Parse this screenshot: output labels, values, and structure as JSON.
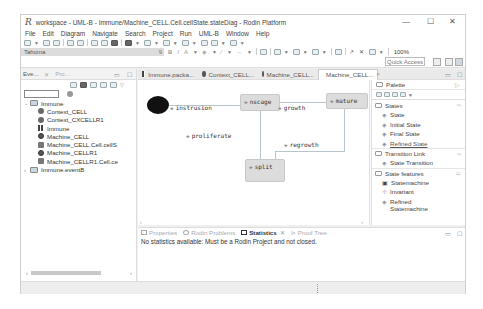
{
  "window": {
    "title": "workspace - UML-B - Immune/Machine_CELL.Cell.cellState.stateDiag - Rodin Platform",
    "app_icon": "R",
    "controls": {
      "minimize": "—",
      "maximize": "☐",
      "close": "✕"
    }
  },
  "menu": [
    "File",
    "Edit",
    "Diagram",
    "Navigate",
    "Search",
    "Project",
    "Run",
    "UML-B",
    "Window",
    "Help"
  ],
  "toolbar": {
    "font_family": "Tahoma",
    "font_size": "9",
    "bold": "B",
    "italic": "I",
    "font_color": "A",
    "zoom": "100%",
    "quick_access": "Quick Access"
  },
  "explorer": {
    "tabs": [
      {
        "label": "Eve...",
        "active": true
      },
      {
        "label": "Pro...",
        "active": false
      }
    ],
    "filter_placeholder": "",
    "tree": [
      {
        "label": "Immune",
        "level": 0,
        "expanded": true,
        "icon": "project"
      },
      {
        "label": "Context_CELL",
        "level": 1,
        "icon": "context"
      },
      {
        "label": "Context_CXCELLR1",
        "level": 1,
        "icon": "context"
      },
      {
        "label": "Immune",
        "level": 1,
        "icon": "package-diagram"
      },
      {
        "label": "Machine_CELL",
        "level": 1,
        "icon": "machine"
      },
      {
        "label": "Machine_CELL.Cell.cellS",
        "level": 1,
        "icon": "statemachine"
      },
      {
        "label": "Machine_CELLR1",
        "level": 1,
        "icon": "machine"
      },
      {
        "label": "Machine_CELLR1.Cell.ce",
        "level": 1,
        "icon": "statemachine"
      },
      {
        "label": "Immune.eventB",
        "level": 0,
        "expanded": false,
        "icon": "project"
      }
    ]
  },
  "editor": {
    "tabs": [
      {
        "label": "Immune.packa...",
        "icon": "package-diagram",
        "active": false
      },
      {
        "label": "Context_CELL...",
        "icon": "context",
        "active": false
      },
      {
        "label": "Machine_CELL...",
        "icon": "machine",
        "active": false
      },
      {
        "label": "Machine_CELL...",
        "icon": "statemachine",
        "active": true,
        "close": "✕"
      }
    ],
    "diagram": {
      "states": [
        {
          "name": "nscage",
          "x": 102,
          "y": 14,
          "w": 40,
          "h": 17
        },
        {
          "name": "mature",
          "x": 188,
          "y": 13,
          "w": 42,
          "h": 16
        },
        {
          "name": "split",
          "x": 107,
          "y": 79,
          "w": 40,
          "h": 23
        }
      ],
      "transitions": [
        {
          "label": "instrusion",
          "x": 32,
          "y": 27
        },
        {
          "label": "growth",
          "x": 140,
          "y": 27
        },
        {
          "label": "proliferate",
          "x": 48,
          "y": 55
        },
        {
          "label": "regrowth",
          "x": 145,
          "y": 64
        }
      ]
    }
  },
  "palette": {
    "title": "Palette",
    "drawers": [
      {
        "label": "States",
        "items": [
          "State",
          "Initial State",
          "Final State",
          "Refined State"
        ]
      },
      {
        "label": "Transition Link",
        "items": [
          "State Transition"
        ]
      },
      {
        "label": "State features",
        "items": [
          "Statemachine",
          "Invariant",
          "Refined Statemachine"
        ]
      }
    ]
  },
  "bottom": {
    "tabs": [
      {
        "label": "Properties",
        "active": false
      },
      {
        "label": "Rodin Problems",
        "active": false
      },
      {
        "label": "Statistics",
        "active": true,
        "close": "✕"
      },
      {
        "label": "Proof Tree",
        "active": false
      }
    ],
    "message": "No statistics available: Must be a Rodin Project and not closed."
  }
}
